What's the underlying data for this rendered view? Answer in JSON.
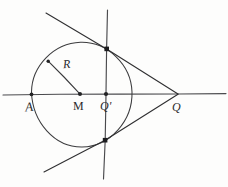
{
  "figure": {
    "title": "Circle with center M, external point Q, polar line through Q prime, and two tangent lines",
    "kind": "hand-drawn-geometry-sketch",
    "width": 228,
    "height": 187,
    "background_color": "#fdfdfc",
    "ink_color": "#3a3a3c"
  },
  "labels": {
    "point_a": "A",
    "center_m": "M",
    "point_q_prime": "Q'",
    "point_q": "Q",
    "radius": "R"
  },
  "geometry": {
    "circle": {
      "center_x": 80,
      "center_y": 94,
      "radius": 52
    },
    "horizontal_axis": {
      "y": 94,
      "x_start": 3,
      "x_end": 226
    },
    "polar_line": {
      "x_top": 107,
      "y_top": 10,
      "x_bottom": 103,
      "y_bottom": 179
    },
    "points": {
      "a": {
        "x": 31,
        "y": 94
      },
      "m": {
        "x": 80,
        "y": 94
      },
      "q_prime": {
        "x": 106,
        "y": 94
      },
      "q": {
        "x": 178,
        "y": 94
      },
      "tangent_upper": {
        "x": 107,
        "y": 49
      },
      "tangent_lower": {
        "x": 105,
        "y": 140
      },
      "radius_end": {
        "x": 48,
        "y": 61
      }
    },
    "tangent_upper_line": {
      "x_start": 46,
      "y_start": 13,
      "x_end": 178,
      "y_end": 94
    },
    "tangent_lower_line": {
      "x_start": 44,
      "y_start": 172,
      "x_end": 178,
      "y_end": 94
    }
  }
}
